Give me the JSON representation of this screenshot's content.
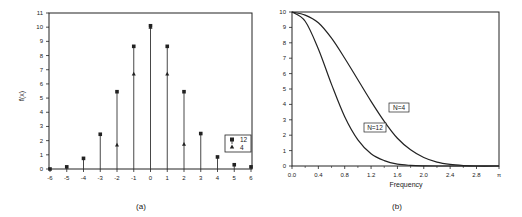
{
  "chart_data": [
    {
      "type": "scatter",
      "subtype": "stem",
      "panel_label": "(a)",
      "title": "",
      "xlabel": "",
      "ylabel": "f(x)",
      "x": [
        -6,
        -5,
        -4,
        -3,
        -2,
        -1,
        0,
        1,
        2,
        3,
        4,
        5,
        6
      ],
      "xticks": [
        "-6",
        "-5",
        "-4",
        "-3",
        "-2",
        "-1",
        "0",
        "1",
        "2",
        "3",
        "4",
        "5",
        "6"
      ],
      "yticks": [
        "0",
        "1",
        "2",
        "3",
        "4",
        "5",
        "6",
        "7",
        "8",
        "9",
        "10",
        "11"
      ],
      "xlim": [
        -6,
        6
      ],
      "ylim": [
        0,
        11
      ],
      "grid": false,
      "legend_position": "lower right",
      "series": [
        {
          "name": "12",
          "marker": "square",
          "values": [
            0.0,
            0.15,
            0.75,
            2.45,
            5.45,
            8.65,
            10.1,
            8.65,
            5.45,
            2.5,
            0.85,
            0.3,
            0.15
          ]
        },
        {
          "name": "4",
          "marker": "triangle",
          "values": [
            null,
            null,
            null,
            null,
            1.7,
            6.7,
            10.0,
            6.7,
            1.75,
            null,
            null,
            null,
            null
          ]
        }
      ]
    },
    {
      "type": "line",
      "panel_label": "(b)",
      "title": "",
      "xlabel": "Frequency",
      "ylabel": "",
      "xticks": [
        "0.0",
        "0.4",
        "0.8",
        "1.2",
        "1.6",
        "2.0",
        "2.4",
        "2.8",
        "π"
      ],
      "yticks": [
        "0",
        "1",
        "2",
        "3",
        "4",
        "5",
        "6",
        "7",
        "8",
        "9",
        "10"
      ],
      "xlim": [
        0,
        3.14159
      ],
      "ylim": [
        0,
        10
      ],
      "grid": false,
      "x": [
        0.0,
        0.2,
        0.4,
        0.6,
        0.8,
        1.0,
        1.2,
        1.4,
        1.6,
        1.8,
        2.0,
        2.2,
        2.4,
        2.6,
        2.8,
        3.14
      ],
      "series": [
        {
          "name": "N=4",
          "values": [
            10.0,
            9.8,
            9.3,
            8.3,
            7.0,
            5.6,
            4.2,
            2.9,
            1.8,
            1.05,
            0.55,
            0.25,
            0.1,
            0.03,
            0.0,
            0.0
          ]
        },
        {
          "name": "N=12",
          "values": [
            10.0,
            9.4,
            7.6,
            5.3,
            3.2,
            1.7,
            0.8,
            0.35,
            0.12,
            0.04,
            0.01,
            0.0,
            0.0,
            0.0,
            0.0,
            0.0
          ]
        }
      ],
      "annotations": [
        "N=4",
        "N=12"
      ]
    }
  ],
  "panel_a": {
    "label": "(a)",
    "ylabel": "f(x)",
    "legend": {
      "items": [
        {
          "label": "12"
        },
        {
          "label": "4"
        }
      ]
    }
  },
  "panel_b": {
    "label": "(b)",
    "xlabel": "Frequency",
    "annotations": {
      "n4": "N=4",
      "n12": "N=12"
    }
  }
}
